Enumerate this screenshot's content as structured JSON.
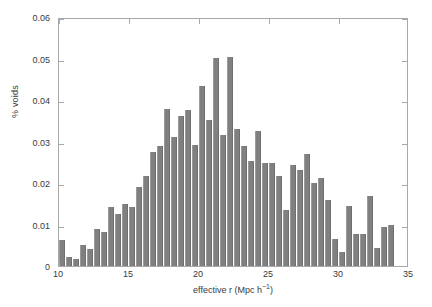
{
  "chart_data": {
    "type": "bar",
    "title": "",
    "subtitle": "",
    "xlabel": "effective r (Mpc h⁻¹)",
    "xlabel_text": "effective r (Mpc h",
    "xlabel_sup": "−1",
    "xlabel_tail": ")",
    "ylabel": "% voids",
    "xlim": [
      10,
      35
    ],
    "ylim": [
      0,
      0.06
    ],
    "grid": false,
    "legend": null,
    "bin_width": 0.5,
    "bar_color": "#808080",
    "axes_color": "#a9a9a9",
    "xticks": [
      10,
      15,
      20,
      25,
      30,
      35
    ],
    "xtick_labels": [
      "10",
      "15",
      "20",
      "25",
      "30",
      "35"
    ],
    "yticks": [
      0,
      0.01,
      0.02,
      0.03,
      0.04,
      0.05,
      0.06
    ],
    "ytick_labels": [
      "0",
      "0.01",
      "0.02",
      "0.03",
      "0.04",
      "0.05",
      "0.06"
    ],
    "categories": [
      10.25,
      10.75,
      11.25,
      11.75,
      12.25,
      12.75,
      13.25,
      13.75,
      14.25,
      14.75,
      15.25,
      15.75,
      16.25,
      16.75,
      17.25,
      17.75,
      18.25,
      18.75,
      19.25,
      19.75,
      20.25,
      20.75,
      21.25,
      21.75,
      22.25,
      22.75,
      23.25,
      23.75,
      24.25,
      24.75,
      25.25,
      25.75,
      26.25,
      26.75,
      27.25,
      27.75,
      28.25,
      28.75,
      29.25,
      29.75,
      30.25,
      30.75,
      31.25,
      31.75,
      32.25,
      32.75,
      33.25,
      33.75
    ],
    "values": [
      0.0063,
      0.0021,
      0.0018,
      0.005,
      0.0042,
      0.0088,
      0.0081,
      0.0141,
      0.0125,
      0.015,
      0.0143,
      0.0191,
      0.0217,
      0.0274,
      0.0288,
      0.0378,
      0.0311,
      0.0362,
      0.0375,
      0.0292,
      0.0434,
      0.0353,
      0.0502,
      0.0315,
      0.0503,
      0.0329,
      0.0288,
      0.0254,
      0.0325,
      0.0249,
      0.0248,
      0.0216,
      0.0134,
      0.0244,
      0.0232,
      0.0271,
      0.0199,
      0.0211,
      0.0158,
      0.0066,
      0.0034,
      0.0144,
      0.0077,
      0.0078,
      0.0168,
      0.0043,
      0.0094,
      0.0098
    ]
  }
}
